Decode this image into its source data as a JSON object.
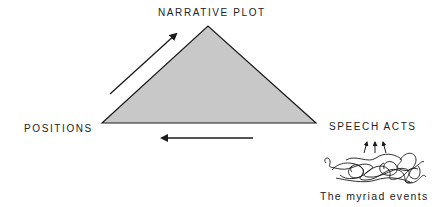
{
  "diagram": {
    "labels": {
      "top": "NARRATIVE PLOT",
      "left": "POSITIONS",
      "right": "SPEECH ACTS",
      "bottom_right": "The myriad events"
    },
    "colors": {
      "triangle_fill": "#c8c8c8",
      "stroke": "#1a1a1a"
    },
    "arrows": [
      {
        "from": "POSITIONS",
        "to": "NARRATIVE PLOT",
        "direction": "up-right"
      },
      {
        "from": "SPEECH ACTS",
        "to": "POSITIONS",
        "direction": "left"
      },
      {
        "from": "The myriad events",
        "to": "SPEECH ACTS",
        "direction": "up",
        "count": 3
      }
    ]
  }
}
